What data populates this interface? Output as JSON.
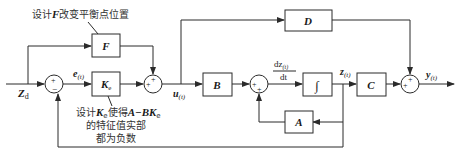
{
  "diagram": {
    "type": "control-system-block-diagram",
    "blocks": {
      "F": "F",
      "Ke": "K",
      "Ke_sub": "e",
      "B": "B",
      "integrator": "∫",
      "C": "C",
      "D": "D",
      "A": "A"
    },
    "signals": {
      "input": "Z",
      "input_sub": "d",
      "error": "e",
      "error_sub": "(t)",
      "control": "u",
      "control_sub": "(t)",
      "derivative_num": "dz",
      "derivative_num_sub": "(t)",
      "derivative_den": "dt",
      "state": "z",
      "state_sub": "(t)",
      "output": "y",
      "output_sub": "(t)"
    },
    "summing_junctions": {
      "sum1": {
        "top": "+",
        "bottom": "−"
      },
      "sum2": {
        "left": "+",
        "top": "+"
      },
      "sum3": {
        "left": "+",
        "bottom": "+"
      },
      "sum4": {
        "left": "+",
        "top": "+"
      }
    },
    "annotations": {
      "f_note": "设计F改变平衡点位置",
      "f_note_parts": [
        "设计",
        "F",
        "改变平衡点位置"
      ],
      "ke_note_line1_parts": [
        "设计",
        "K",
        "e",
        "使得",
        "A−BK",
        "e"
      ],
      "ke_note_line2": "的特征值实部",
      "ke_note_line3": "都为负数"
    }
  }
}
